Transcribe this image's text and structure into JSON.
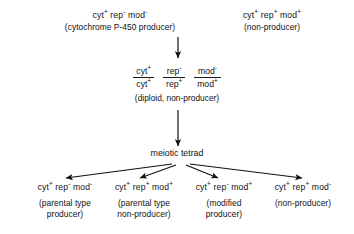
{
  "diagram": {
    "parents": [
      {
        "genotype": {
          "cyt": "+",
          "rep": "-",
          "mod": "-"
        },
        "genotype_text": "cyt+ rep- mod-",
        "description": "(cytochrome P-450 producer)"
      },
      {
        "genotype": {
          "cyt": "+",
          "rep": "+",
          "mod": "+"
        },
        "genotype_text": "cyt+ rep+ mod+",
        "description": "(non-producer)"
      }
    ],
    "diploid": {
      "fractions": [
        {
          "numerator_gene": "cyt",
          "numerator_allele": "+",
          "denominator_gene": "cyt",
          "denominator_allele": "+"
        },
        {
          "numerator_gene": "rep",
          "numerator_allele": "-",
          "denominator_gene": "rep",
          "denominator_allele": "+"
        },
        {
          "numerator_gene": "mod",
          "numerator_allele": "-",
          "denominator_gene": "mod",
          "denominator_allele": "+"
        }
      ],
      "caption": "(diploid, non-producer)"
    },
    "tetrad_label": "meiotic tetrad",
    "products": [
      {
        "genotype": {
          "cyt": "+",
          "rep": "-",
          "mod": "-"
        },
        "genotype_text": "cyt+ rep- mod-",
        "description_line1": "(parental type",
        "description_line2": "producer)"
      },
      {
        "genotype": {
          "cyt": "+",
          "rep": "+",
          "mod": "+"
        },
        "genotype_text": "cyt+ rep+ mod+",
        "description_line1": "(parental type",
        "description_line2": "non-producer)"
      },
      {
        "genotype": {
          "cyt": "+",
          "rep": "-",
          "mod": "+"
        },
        "genotype_text": "cyt+ rep- mod+",
        "description_line1": "(modified",
        "description_line2": "producer)"
      },
      {
        "genotype": {
          "cyt": "+",
          "rep": "+",
          "mod": "-"
        },
        "genotype_text": "cyt+ rep+ mod-",
        "description_line1": "(non-producer)",
        "description_line2": ""
      }
    ],
    "colors": {
      "background": "#ffffff",
      "ink": "#111111",
      "rule": "#1a1a1a"
    }
  }
}
